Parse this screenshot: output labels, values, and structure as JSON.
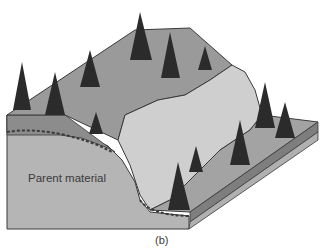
{
  "figure": {
    "caption": "(b)",
    "labels": {
      "parent_material": "Parent material"
    },
    "colors": {
      "background": "#ffffff",
      "surface_soil": "#9a9a9a",
      "landslide_scar": "#cfcfcf",
      "parent_material": "#b5b5b5",
      "topsoil_band": "#7e7e7e",
      "tree": "#2b2b2b",
      "outline": "#3a3a3a"
    },
    "trees": [
      {
        "x": 22,
        "y": 62
      },
      {
        "x": 55,
        "y": 72
      },
      {
        "x": 90,
        "y": 50
      },
      {
        "x": 140,
        "y": 12
      },
      {
        "x": 170,
        "y": 32
      },
      {
        "x": 205,
        "y": 46
      },
      {
        "x": 96,
        "y": 112
      },
      {
        "x": 265,
        "y": 82
      },
      {
        "x": 285,
        "y": 102
      },
      {
        "x": 240,
        "y": 120
      },
      {
        "x": 196,
        "y": 146
      },
      {
        "x": 178,
        "y": 162
      }
    ]
  }
}
